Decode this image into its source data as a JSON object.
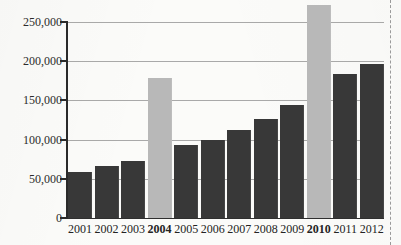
{
  "chart_data": {
    "type": "bar",
    "title": "",
    "subtitle": "",
    "xlabel": "",
    "ylabel": "",
    "categories": [
      "2001",
      "2002",
      "2003",
      "2004",
      "2005",
      "2006",
      "2007",
      "2008",
      "2009",
      "2010",
      "2011",
      "2012"
    ],
    "values": [
      59000,
      66000,
      73000,
      178000,
      93000,
      99000,
      112000,
      126000,
      144000,
      272000,
      184000,
      196000
    ],
    "highlighted_categories": [
      "2004",
      "2010"
    ],
    "bold_tick_labels": [
      "2004",
      "2010"
    ],
    "ylim": [
      0,
      250000
    ],
    "ytick_values": [
      0,
      50000,
      100000,
      150000,
      200000,
      250000
    ],
    "ytick_labels": [
      "0",
      "50,000",
      "100,000",
      "150,000",
      "200,000",
      "250,000"
    ],
    "grid": true,
    "grid_axis": "y",
    "legend": false,
    "legend_position": "none",
    "bar_color": "#383838",
    "highlight_bar_color": "#b8b8b8",
    "gridline_color": "#8d8d8d",
    "axis_color": "#2a2a2a",
    "background_color": "#fbfbf9",
    "note": "2010 bar exceeds the topmost 250,000 gridline"
  },
  "page": {
    "margin_rule": "dashed-vertical-line-right"
  }
}
